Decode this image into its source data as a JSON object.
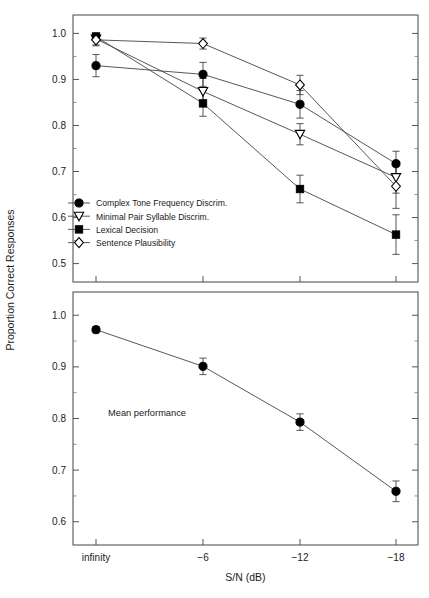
{
  "axes": {
    "ylabel": "Proportion Correct Responses",
    "xlabel": "S/N (dB)",
    "xticklabels": [
      "infinity",
      "−6",
      "−12",
      "−18"
    ],
    "top_yticklabels": [
      "0.5",
      "0.6",
      "0.7",
      "0.8",
      "0.9",
      "1.0"
    ],
    "bottom_yticklabels": [
      "0.6",
      "0.7",
      "0.8",
      "0.9",
      "1.0"
    ]
  },
  "annotations": {
    "mean_performance": "Mean performance"
  },
  "chart_data": [
    {
      "type": "line",
      "panel": "top",
      "title": "",
      "xlabel": "S/N (dB)",
      "ylabel": "Proportion Correct Responses",
      "x": [
        "infinity",
        "-6",
        "-12",
        "-18"
      ],
      "ylim": [
        0.46,
        1.04
      ],
      "yticks": [
        0.5,
        0.6,
        0.7,
        0.8,
        0.9,
        1.0
      ],
      "grid": false,
      "legend_position": "lower-left-inside",
      "series": [
        {
          "name": "Complex Tone Frequency Discrim.",
          "marker": "filled-circle",
          "values": [
            0.93,
            0.911,
            0.846,
            0.717
          ],
          "errors": [
            0.024,
            0.026,
            0.03,
            0.027
          ]
        },
        {
          "name": "Minimal Pair Syllable Discrim.",
          "marker": "open-down-triangle",
          "values": [
            0.988,
            0.874,
            0.781,
            0.687
          ],
          "errors": [
            0.013,
            0.028,
            0.023,
            0.034
          ]
        },
        {
          "name": "Lexical Decision",
          "marker": "filled-square",
          "values": [
            0.993,
            0.848,
            0.662,
            0.563
          ],
          "errors": [
            0.008,
            0.028,
            0.03,
            0.043
          ]
        },
        {
          "name": "Sentence Plausibility",
          "marker": "open-diamond",
          "values": [
            0.986,
            0.978,
            0.888,
            0.668
          ],
          "errors": [
            0.013,
            0.012,
            0.021,
            0.048
          ]
        }
      ]
    },
    {
      "type": "line",
      "panel": "bottom",
      "title": "",
      "xlabel": "S/N (dB)",
      "ylabel": "Proportion Correct Responses",
      "x": [
        "infinity",
        "-6",
        "-12",
        "-18"
      ],
      "ylim": [
        0.555,
        1.045
      ],
      "yticks": [
        0.6,
        0.7,
        0.8,
        0.9,
        1.0
      ],
      "grid": false,
      "annotation": "Mean performance",
      "series": [
        {
          "name": "Mean performance",
          "marker": "filled-circle",
          "values": [
            0.972,
            0.901,
            0.793,
            0.659
          ],
          "errors": [
            0.006,
            0.016,
            0.016,
            0.02
          ]
        }
      ]
    }
  ]
}
